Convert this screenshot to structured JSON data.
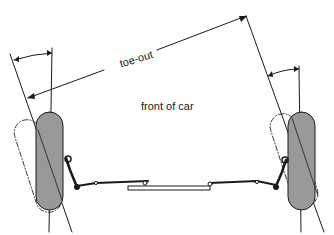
{
  "diagram": {
    "labels": {
      "toe_out": "toe-out",
      "front": "front of car"
    },
    "colors": {
      "line": "#1a1a1a",
      "tyre_fill": "#999999",
      "background": "#ffffff"
    },
    "components": [
      "left-wheel",
      "right-wheel",
      "left-toe-angle-arc",
      "right-toe-angle-arc",
      "toe-out-dimension-line",
      "steering-track-rods",
      "steering-rack"
    ]
  }
}
